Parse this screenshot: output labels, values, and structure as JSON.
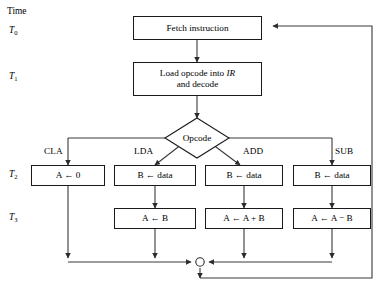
{
  "diagram": {
    "title_label": "Time",
    "type": "flowchart",
    "time_steps": [
      {
        "name": "T0",
        "base": "T",
        "sub": "0"
      },
      {
        "name": "T1",
        "base": "T",
        "sub": "1"
      },
      {
        "name": "T2",
        "base": "T",
        "sub": "2"
      },
      {
        "name": "T3",
        "base": "T",
        "sub": "3"
      }
    ],
    "process_boxes": {
      "fetch": {
        "text": "Fetch instruction"
      },
      "load": {
        "line1_pre": "Load opcode into ",
        "line1_italic": "IR",
        "line2": "and decode"
      }
    },
    "decision": {
      "text": "Opcode"
    },
    "branches": [
      {
        "label": "CLA",
        "t2": "A ← 0",
        "t3": null
      },
      {
        "label": "LDA",
        "t2": "B ← data",
        "t3": "A ← B"
      },
      {
        "label": "ADD",
        "t2": "B ← data",
        "t3": "A ← A + B"
      },
      {
        "label": "SUB",
        "t2": "B ← data",
        "t3": "A ← A − B"
      }
    ],
    "junction": {
      "name": "merge-node",
      "shape": "circle"
    },
    "colors": {
      "line": "#3a3a3a",
      "box_border": "#1a1a1a",
      "text": "#000000",
      "background": "#ffffff"
    }
  }
}
